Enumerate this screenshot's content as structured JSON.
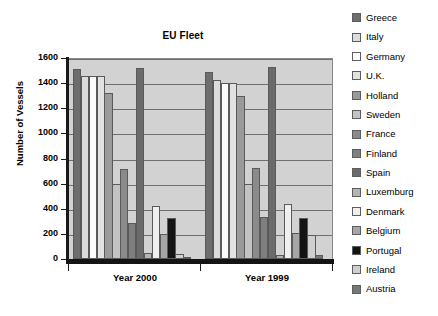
{
  "chart_data": {
    "type": "bar",
    "title": "EU Fleet",
    "xlabel": "",
    "ylabel": "Number of Vessels",
    "ylim": [
      0,
      1600
    ],
    "ytick_step": 200,
    "yticks": [
      1600,
      1400,
      1200,
      1000,
      800,
      600,
      400,
      200,
      0
    ],
    "categories": [
      "Year 2000",
      "Year 1999"
    ],
    "grid": true,
    "legend_position": "right",
    "series": [
      {
        "name": "Greece",
        "color": "#6e6e6e",
        "values": [
          1515,
          1490
        ]
      },
      {
        "name": "Italy",
        "color": "#dcdcdc",
        "values": [
          1460,
          1425
        ]
      },
      {
        "name": "Germany",
        "color": "#fbfbfb",
        "values": [
          1455,
          1405
        ]
      },
      {
        "name": "U.K.",
        "color": "#e2e2e2",
        "values": [
          1455,
          1405
        ]
      },
      {
        "name": "Holland",
        "color": "#9a9a9a",
        "values": [
          1325,
          1300
        ]
      },
      {
        "name": "Sweden",
        "color": "#c3c3c3",
        "values": [
          600,
          600
        ]
      },
      {
        "name": "France",
        "color": "#8b8b8b",
        "values": [
          720,
          725
        ]
      },
      {
        "name": "Finland",
        "color": "#7f7f7f",
        "values": [
          290,
          335
        ]
      },
      {
        "name": "Spain",
        "color": "#6b6b6b",
        "values": [
          1520,
          1530
        ]
      },
      {
        "name": "Luxemburg",
        "color": "#b4b4b4",
        "values": [
          50,
          30
        ]
      },
      {
        "name": "Denmark",
        "color": "#efefef",
        "values": [
          425,
          440
        ]
      },
      {
        "name": "Belgium",
        "color": "#a6a6a6",
        "values": [
          200,
          210
        ]
      },
      {
        "name": "Portugal",
        "color": "#141414",
        "values": [
          330,
          325
        ]
      },
      {
        "name": "Ireland",
        "color": "#cfcfcf",
        "values": [
          40,
          195
        ]
      },
      {
        "name": "Austria",
        "color": "#777777",
        "values": [
          10,
          35
        ]
      }
    ]
  },
  "legend": {
    "items": [
      {
        "label": "Greece"
      },
      {
        "label": "Italy"
      },
      {
        "label": "Germany"
      },
      {
        "label": "U.K."
      },
      {
        "label": "Holland"
      },
      {
        "label": "Sweden"
      },
      {
        "label": "France"
      },
      {
        "label": "Finland"
      },
      {
        "label": "Spain"
      },
      {
        "label": "Luxemburg"
      },
      {
        "label": "Denmark"
      },
      {
        "label": "Belgium"
      },
      {
        "label": "Portugal"
      },
      {
        "label": "Ireland"
      },
      {
        "label": "Austria"
      }
    ]
  },
  "colors": {
    "plot_background": "#d2d2d2",
    "axis": "#141414",
    "gridline": "#6f6f6f",
    "page_background": "#ffffff"
  }
}
